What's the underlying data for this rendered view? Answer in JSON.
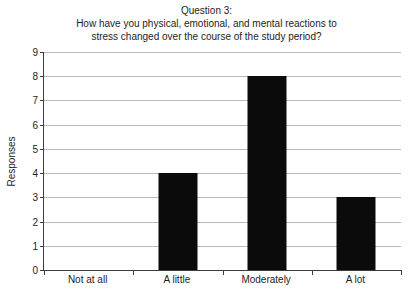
{
  "chart_data": {
    "type": "bar",
    "title": "Question 3:\nHow have you physical, emotional, and mental reactions to stress changed over the course of the study period?",
    "title_lines": [
      "Question 3:",
      "How have you physical, emotional, and mental reactions to",
      "stress changed over the course of the study period?"
    ],
    "categories": [
      "Not at all",
      "A little",
      "Moderately",
      "A lot"
    ],
    "values": [
      0,
      4,
      8,
      3
    ],
    "xlabel": "",
    "ylabel": "Responses",
    "ylim": [
      0,
      9
    ],
    "yticks": [
      0,
      1,
      2,
      3,
      4,
      5,
      6,
      7,
      8,
      9
    ],
    "ytick_labels": [
      "0",
      "1",
      "2",
      "3",
      "4",
      "5",
      "6",
      "7",
      "8",
      "9"
    ],
    "grid": true,
    "legend": false,
    "bar_color": "#0b0b0b",
    "gridline_color": "#b9b9b9",
    "axis_color": "#3c3c3c",
    "background_color": "#ffffff"
  }
}
